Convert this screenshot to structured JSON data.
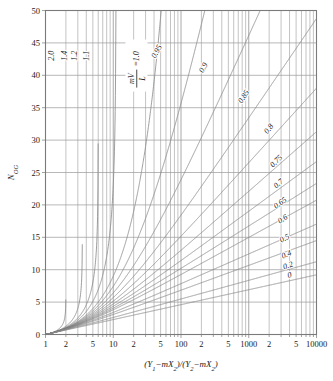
{
  "chart_data": {
    "type": "line",
    "title": "",
    "xlabel": "(Y1-mX2)/(Y2-mX2)",
    "ylabel": "NOG",
    "xscale": "log",
    "yscale": "linear",
    "xlim": [
      1,
      10000
    ],
    "ylim": [
      0,
      50
    ],
    "grid": true,
    "legend_position": "inline-curve-labels",
    "x_tick_labels": [
      "1",
      "2",
      "5",
      "10",
      "2",
      "5",
      "100",
      "2",
      "5",
      "1000",
      "2",
      "5",
      "10000"
    ],
    "x_tick_values": [
      1,
      2,
      5,
      10,
      20,
      50,
      100,
      200,
      500,
      1000,
      2000,
      5000,
      10000
    ],
    "y_tick_labels": [
      "0",
      "5",
      "10",
      "15",
      "20",
      "25",
      "30",
      "35",
      "40",
      "45",
      "50"
    ],
    "y_tick_values": [
      0,
      5,
      10,
      15,
      20,
      25,
      30,
      35,
      40,
      45,
      50
    ],
    "parameter_name": "mV/L",
    "parameter_label_text": "=1.0",
    "series": [
      {
        "name": "2.0",
        "A_inv": 2.0
      },
      {
        "name": "1.4",
        "A_inv": 1.4
      },
      {
        "name": "1.2",
        "A_inv": 1.2
      },
      {
        "name": "1.1",
        "A_inv": 1.1
      },
      {
        "name": "1.0",
        "A_inv": 1.0
      },
      {
        "name": "0.95",
        "A_inv": 0.95
      },
      {
        "name": "0.9",
        "A_inv": 0.9
      },
      {
        "name": "0.85",
        "A_inv": 0.85
      },
      {
        "name": "0.8",
        "A_inv": 0.8
      },
      {
        "name": "0.75",
        "A_inv": 0.75
      },
      {
        "name": "0.7",
        "A_inv": 0.7
      },
      {
        "name": "0.65",
        "A_inv": 0.65
      },
      {
        "name": "0.6",
        "A_inv": 0.6
      },
      {
        "name": "0.5",
        "A_inv": 0.5
      },
      {
        "name": "0.4",
        "A_inv": 0.4
      },
      {
        "name": "0.2",
        "A_inv": 0.2
      },
      {
        "name": "0",
        "A_inv": 0.0
      }
    ],
    "curve_labels": [
      {
        "text": "2.0",
        "x": 1.35,
        "y": 43.0,
        "rotate": -90
      },
      {
        "text": "1.4",
        "x": 2.05,
        "y": 43.0,
        "rotate": -90
      },
      {
        "text": "1.2",
        "x": 2.95,
        "y": 43.0,
        "rotate": -90
      },
      {
        "text": "1.1",
        "x": 4.35,
        "y": 43.0,
        "rotate": -90
      },
      {
        "text": "0.95",
        "x": 47.0,
        "y": 43.5,
        "rotate": -62
      },
      {
        "text": "0.9",
        "x": 230.0,
        "y": 41.0,
        "rotate": -60
      },
      {
        "text": "0.85",
        "x": 900.0,
        "y": 36.5,
        "rotate": -56
      },
      {
        "text": "0.8",
        "x": 2100.0,
        "y": 31.5,
        "rotate": -52
      },
      {
        "text": "0.75",
        "x": 2700.0,
        "y": 26.5,
        "rotate": -45
      },
      {
        "text": "0.7",
        "x": 2900.0,
        "y": 23.0,
        "rotate": -40
      },
      {
        "text": "0.65",
        "x": 3050.0,
        "y": 20.0,
        "rotate": -36
      },
      {
        "text": "0.6",
        "x": 3300.0,
        "y": 17.5,
        "rotate": -32
      },
      {
        "text": "0.5",
        "x": 3500.0,
        "y": 14.5,
        "rotate": -27
      },
      {
        "text": "0.4",
        "x": 3700.0,
        "y": 12.0,
        "rotate": -23
      },
      {
        "text": "0.2",
        "x": 3900.0,
        "y": 10.3,
        "rotate": -19
      },
      {
        "text": "0",
        "x": 4100.0,
        "y": 8.8,
        "rotate": -16
      }
    ],
    "colors": {
      "curve": "#8c8c8c",
      "grid": "#9a9a9a",
      "frame": "#7a7a7a",
      "text": "#1a1a1a",
      "background": "#ffffff"
    }
  },
  "axes": {
    "x_axis_title_parts": {
      "open1": "(",
      "Y": "Y",
      "sub1": "1",
      "minus": "−",
      "m": "m",
      "X": "X",
      "sub2": "2",
      "close1": ")",
      "slash": "/",
      "open2": "(",
      "sub3": "2",
      "close2": ")"
    },
    "y_axis_title_main": "N",
    "y_axis_title_sub": "OG"
  }
}
